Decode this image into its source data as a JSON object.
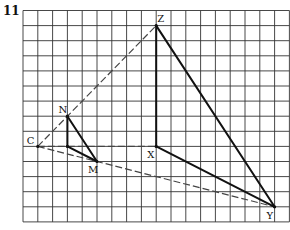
{
  "question_number": "11",
  "grid": {
    "cols": 18,
    "rows": 14,
    "origin_x": 23,
    "origin_y": 10.5,
    "cell_w": 14.8,
    "cell_h": 15.1,
    "line_color": "#333333"
  },
  "points": {
    "C": {
      "label": "C",
      "col": 1,
      "row": 9,
      "label_dx": -11,
      "label_dy": -2
    },
    "N": {
      "label": "N",
      "col": 3,
      "row": 7,
      "label_dx": -9,
      "label_dy": -3
    },
    "M": {
      "label": "M",
      "col": 5,
      "row": 10,
      "label_dx": -9,
      "label_dy": 11
    },
    "Q": {
      "label": "",
      "col": 3,
      "row": 9
    },
    "X": {
      "label": "X",
      "col": 9,
      "row": 9,
      "label_dx": -9,
      "label_dy": 12
    },
    "Z": {
      "label": "Z",
      "col": 9,
      "row": 1,
      "label_dx": 1,
      "label_dy": -4
    },
    "Y": {
      "label": "Y",
      "col": 17,
      "row": 13,
      "label_dx": -8,
      "label_dy": 12
    }
  },
  "solid_segments": [
    [
      "N",
      "Q"
    ],
    [
      "Q",
      "M"
    ],
    [
      "N",
      "M"
    ],
    [
      "Z",
      "X"
    ],
    [
      "X",
      "Y"
    ],
    [
      "Z",
      "Y"
    ]
  ],
  "dashed_segments": [
    [
      "C",
      "Z"
    ],
    [
      "C",
      "Y"
    ],
    [
      "C",
      "X"
    ]
  ]
}
